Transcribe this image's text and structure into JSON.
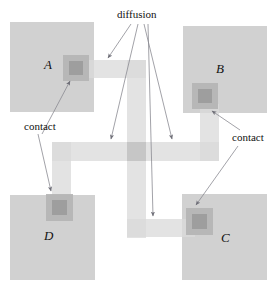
{
  "diagram": {
    "labels": {
      "diffusion": "diffusion",
      "contact_left": "contact",
      "contact_right": "contact"
    },
    "regions": [
      {
        "id": "A",
        "label": "A",
        "x": 10,
        "y": 22,
        "w": 84,
        "h": 90
      },
      {
        "id": "B",
        "label": "B",
        "x": 183,
        "y": 26,
        "w": 84,
        "h": 87
      },
      {
        "id": "D",
        "label": "D",
        "x": 10,
        "y": 195,
        "w": 85,
        "h": 85
      },
      {
        "id": "C",
        "label": "C",
        "x": 182,
        "y": 194,
        "w": 85,
        "h": 86
      }
    ],
    "region_label_positions": [
      {
        "id": "A",
        "x": 44,
        "y": 64
      },
      {
        "id": "B",
        "x": 216,
        "y": 68
      },
      {
        "id": "D",
        "x": 44,
        "y": 233
      },
      {
        "id": "C",
        "x": 221,
        "y": 235
      }
    ],
    "contacts": [
      {
        "id": "contact-A",
        "x": 63,
        "y": 55,
        "w": 26,
        "h": 26,
        "inner_inset": 6
      },
      {
        "id": "contact-B",
        "x": 192,
        "y": 83,
        "w": 26,
        "h": 26,
        "inner_inset": 6
      },
      {
        "id": "contact-D",
        "x": 46,
        "y": 194,
        "w": 27,
        "h": 27,
        "inner_inset": 6
      },
      {
        "id": "contact-C",
        "x": 186,
        "y": 208,
        "w": 27,
        "h": 27,
        "inner_inset": 6
      },
      {
        "id": "contact-center",
        "x": 127,
        "y": 142,
        "w": 19,
        "h": 19,
        "inner_inset": 0
      }
    ],
    "tracks": [
      {
        "id": "track-top-horizontal",
        "x": 80,
        "y": 60,
        "w": 66,
        "h": 18
      },
      {
        "id": "track-center-vertical",
        "x": 127,
        "y": 60,
        "w": 19,
        "h": 178
      },
      {
        "id": "track-middle-horizontal",
        "x": 52,
        "y": 142,
        "w": 167,
        "h": 19
      },
      {
        "id": "track-left-vertical",
        "x": 52,
        "y": 142,
        "w": 19,
        "h": 63
      },
      {
        "id": "track-right-vertical",
        "x": 200,
        "y": 104,
        "w": 19,
        "h": 57
      },
      {
        "id": "track-bottom-horizontal",
        "x": 127,
        "y": 219,
        "w": 68,
        "h": 18
      }
    ],
    "label_positions": {
      "diffusion": {
        "x": 117,
        "y": 9
      },
      "contact_left": {
        "x": 24,
        "y": 121
      },
      "contact_right": {
        "x": 232,
        "y": 132
      }
    },
    "leader_lines": [
      {
        "id": "leader-diffusion-to-top-track",
        "x1": 131,
        "y1": 24,
        "x2": 108,
        "y2": 58
      },
      {
        "id": "leader-diffusion-to-left-mid",
        "x1": 138,
        "y1": 24,
        "x2": 111,
        "y2": 140
      },
      {
        "id": "leader-diffusion-to-right-mid",
        "x1": 144,
        "y1": 24,
        "x2": 172,
        "y2": 140
      },
      {
        "id": "leader-diffusion-to-bottom-track",
        "x1": 148,
        "y1": 24,
        "x2": 153,
        "y2": 216
      },
      {
        "id": "leader-contact-left-to-A",
        "x1": 42,
        "y1": 134,
        "x2": 70,
        "y2": 80
      },
      {
        "id": "leader-contact-left-to-D",
        "x1": 38,
        "y1": 134,
        "x2": 51,
        "y2": 192
      },
      {
        "id": "leader-contact-right-to-B",
        "x1": 238,
        "y1": 130,
        "x2": 211,
        "y2": 110
      },
      {
        "id": "leader-contact-right-to-C",
        "x1": 238,
        "y1": 145,
        "x2": 195,
        "y2": 205
      }
    ],
    "colors": {
      "well_fill": "#cfcfcf",
      "track_fill": "#d9d9d9",
      "contact_outer": "#b4b4b4",
      "contact_inner": "#9c9c9c",
      "leader_stroke": "#8a8a92",
      "text": "#111111",
      "background": "#ffffff"
    }
  }
}
